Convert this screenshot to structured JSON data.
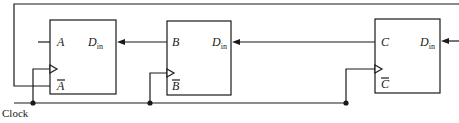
{
  "diagram": {
    "type": "shift-register-circuit",
    "clock_label": "Clock",
    "flip_flops": [
      {
        "name": "A",
        "output": "A",
        "inverted_output": "A",
        "input_label": "D",
        "input_sub": "in"
      },
      {
        "name": "B",
        "output": "B",
        "inverted_output": "B",
        "input_label": "D",
        "input_sub": "in"
      },
      {
        "name": "C",
        "output": "C",
        "inverted_output": "C",
        "input_label": "D",
        "input_sub": "in"
      }
    ],
    "colors": {
      "line": "#1a1a1a",
      "background": "#ffffff"
    }
  }
}
